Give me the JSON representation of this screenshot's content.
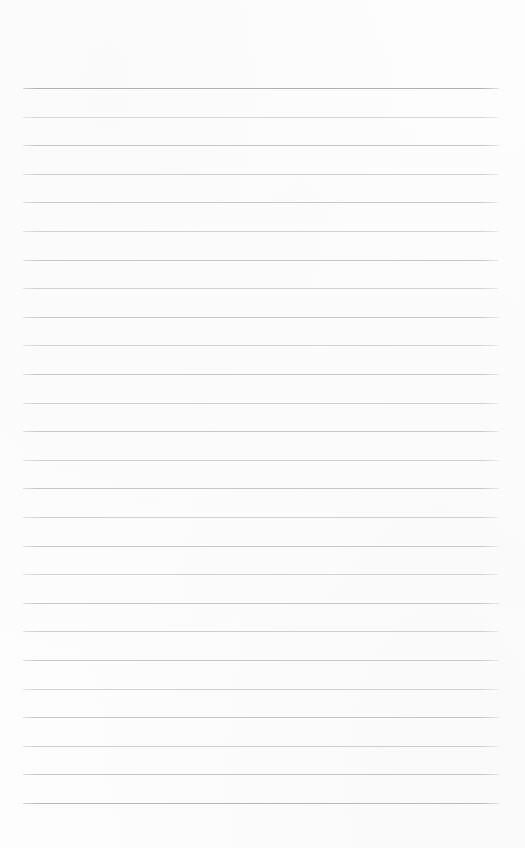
{
  "page": {
    "kind": "ruled-notepad-page",
    "width": 525,
    "height": 848,
    "background_color": "#fdfdfd",
    "content_text": "",
    "is_blank": true
  },
  "layout": {
    "rule_left_x": 23,
    "rule_right_x": 499,
    "rule_width": 476,
    "first_rule_y": 88,
    "last_rule_y": 803,
    "rule_spacing": 28.6,
    "rule_count": 26,
    "top_margin_height": 88,
    "bottom_margin_height": 45
  },
  "colors": {
    "header_rule": "#b0b2b4",
    "body_rule": "#c9cbcd",
    "body_rule_light": "#d2d4d6",
    "paper": "#fdfdfd"
  },
  "rules": [
    {
      "index": 1,
      "y": 88,
      "color": "#aeb0b2",
      "thickness": 1.4,
      "emphasis": "header"
    },
    {
      "index": 2,
      "y": 116.6,
      "color": "#d4d6d8",
      "thickness": 1,
      "emphasis": "body"
    },
    {
      "index": 3,
      "y": 145.2,
      "color": "#c4c6c8",
      "thickness": 1,
      "emphasis": "body"
    },
    {
      "index": 4,
      "y": 173.8,
      "color": "#cdcfd1",
      "thickness": 1,
      "emphasis": "body"
    },
    {
      "index": 5,
      "y": 202.4,
      "color": "#c8cacc",
      "thickness": 1,
      "emphasis": "body"
    },
    {
      "index": 6,
      "y": 231.0,
      "color": "#d0d2d4",
      "thickness": 1,
      "emphasis": "body"
    },
    {
      "index": 7,
      "y": 259.6,
      "color": "#c6c8ca",
      "thickness": 1,
      "emphasis": "body"
    },
    {
      "index": 8,
      "y": 288.2,
      "color": "#cfd1d3",
      "thickness": 1,
      "emphasis": "body"
    },
    {
      "index": 9,
      "y": 316.8,
      "color": "#c7c9cb",
      "thickness": 1,
      "emphasis": "body"
    },
    {
      "index": 10,
      "y": 345.4,
      "color": "#d1d3d5",
      "thickness": 1,
      "emphasis": "body"
    },
    {
      "index": 11,
      "y": 374.0,
      "color": "#c5c7c9",
      "thickness": 1,
      "emphasis": "body"
    },
    {
      "index": 12,
      "y": 402.6,
      "color": "#cecfd1",
      "thickness": 1,
      "emphasis": "body"
    },
    {
      "index": 13,
      "y": 431.2,
      "color": "#c6c8ca",
      "thickness": 1,
      "emphasis": "body"
    },
    {
      "index": 14,
      "y": 459.8,
      "color": "#d0d2d4",
      "thickness": 1,
      "emphasis": "body"
    },
    {
      "index": 15,
      "y": 488.4,
      "color": "#c4c6c8",
      "thickness": 1,
      "emphasis": "body"
    },
    {
      "index": 16,
      "y": 517.0,
      "color": "#cdcfd1",
      "thickness": 1,
      "emphasis": "body"
    },
    {
      "index": 17,
      "y": 545.6,
      "color": "#c7c9cb",
      "thickness": 1,
      "emphasis": "body"
    },
    {
      "index": 18,
      "y": 574.2,
      "color": "#d1d3d5",
      "thickness": 1,
      "emphasis": "body"
    },
    {
      "index": 19,
      "y": 602.8,
      "color": "#c5c7c9",
      "thickness": 1,
      "emphasis": "body"
    },
    {
      "index": 20,
      "y": 631.4,
      "color": "#cccecf",
      "thickness": 1,
      "emphasis": "body"
    },
    {
      "index": 21,
      "y": 660.0,
      "color": "#c6c8ca",
      "thickness": 1,
      "emphasis": "body"
    },
    {
      "index": 22,
      "y": 688.6,
      "color": "#d0d2d4",
      "thickness": 1,
      "emphasis": "body"
    },
    {
      "index": 23,
      "y": 717.2,
      "color": "#c3c5c7",
      "thickness": 1,
      "emphasis": "body"
    },
    {
      "index": 24,
      "y": 745.8,
      "color": "#cbcdcf",
      "thickness": 1,
      "emphasis": "body"
    },
    {
      "index": 25,
      "y": 774.4,
      "color": "#c2c4c6",
      "thickness": 1,
      "emphasis": "body"
    },
    {
      "index": 26,
      "y": 803.0,
      "color": "#b6b8ba",
      "thickness": 1.1,
      "emphasis": "body"
    }
  ]
}
